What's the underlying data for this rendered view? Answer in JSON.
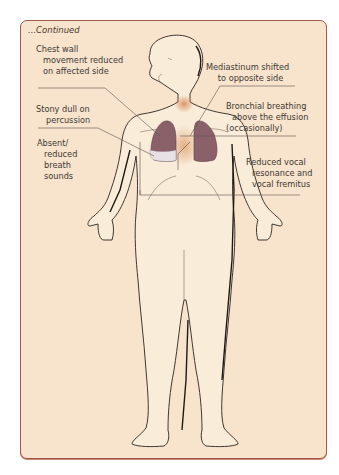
{
  "header": {
    "continued_label": "...Continued"
  },
  "colors": {
    "panel_background": "#f8e3cc",
    "panel_border": "#a5574a",
    "body_fill": "#f9ecd9",
    "outline": "#2b2520",
    "lung_fill": "#8a6168",
    "effusion_fill": "#e7e0e4",
    "mediastinum_glow": "#d9905e",
    "leader_line": "#5e5650"
  },
  "annotations": [
    {
      "id": "chest-wall",
      "side": "left",
      "lines": [
        "Chest wall",
        "movement reduced",
        "on affected side"
      ]
    },
    {
      "id": "stony-dull",
      "side": "left",
      "lines": [
        "Stony dull on",
        "percussion"
      ]
    },
    {
      "id": "breath-sounds",
      "side": "left",
      "lines": [
        "Absent/",
        "reduced",
        "breath",
        "sounds"
      ]
    },
    {
      "id": "mediastinum",
      "side": "right",
      "lines": [
        "Mediastinum shifted",
        "to opposite side"
      ]
    },
    {
      "id": "bronchial-breathing",
      "side": "right",
      "lines": [
        "Bronchial breathing",
        "above the effusion",
        "(occasionally)"
      ]
    },
    {
      "id": "vocal-resonance",
      "side": "right",
      "lines": [
        "Reduced vocal",
        "resonance and",
        "vocal fremitus"
      ]
    }
  ]
}
